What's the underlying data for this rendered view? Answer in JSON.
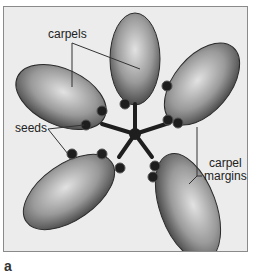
{
  "figure": {
    "panel_letter": "a",
    "labels": {
      "carpels": "carpels",
      "seeds": "seeds",
      "carpel_margins_line1": "carpel",
      "carpel_margins_line2": "margins"
    },
    "colors": {
      "background": "#ececec",
      "frame_border": "#8a8a8a",
      "carpel_dark": "#3a3a3a",
      "carpel_light": "#cfcfcf",
      "seed": "#1e1e1e",
      "leader_line": "#333333"
    }
  }
}
